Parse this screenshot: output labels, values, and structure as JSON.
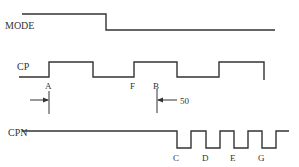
{
  "diagram": {
    "type": "timing-diagram",
    "stroke_color": "#333333",
    "background": "#ffffff",
    "signals": [
      {
        "name": "MODE",
        "label_pos": [
          5,
          29
        ],
        "path": "M 22 14 L 106 14 L 106 30 L 275 30"
      },
      {
        "name": "CP",
        "label_pos": [
          17,
          70
        ],
        "path": "M 19 77 L 49 77 L 49 62 L 93 62 L 93 77 L 134 77 L 134 62 L 177 62 L 177 77 L 219 77 L 219 62 L 264 62 L 264 80"
      },
      {
        "name": "CPN",
        "label_pos": [
          8,
          136
        ],
        "path": "M 22 131 L 177 131 L 177 148 L 191 148 L 191 131 L 206 131 L 206 148 L 220 148 L 220 131 L 234 131 L 234 148 L 248 148 L 248 131 L 262 131 L 262 148 L 276 148 L 276 131 L 289 131"
      }
    ],
    "point_labels": [
      {
        "text": "A",
        "x": 45,
        "y": 89
      },
      {
        "text": "F",
        "x": 130,
        "y": 89
      },
      {
        "text": "B",
        "x": 153,
        "y": 89
      },
      {
        "text": "C",
        "x": 173,
        "y": 161
      },
      {
        "text": "D",
        "x": 202,
        "y": 161
      },
      {
        "text": "E",
        "x": 230,
        "y": 161
      },
      {
        "text": "G",
        "x": 258,
        "y": 161
      }
    ],
    "markers": [
      {
        "name": "marker-a",
        "vline": [
          49,
          91,
          49,
          114
        ],
        "arrow": [
          30,
          100,
          48,
          100
        ],
        "direction": "right"
      },
      {
        "name": "marker-b",
        "vline": [
          157,
          89,
          157,
          113
        ],
        "arrow": [
          177,
          100,
          158,
          100
        ],
        "direction": "left"
      }
    ],
    "annotation": {
      "text": "50",
      "x": 180,
      "y": 104
    }
  }
}
